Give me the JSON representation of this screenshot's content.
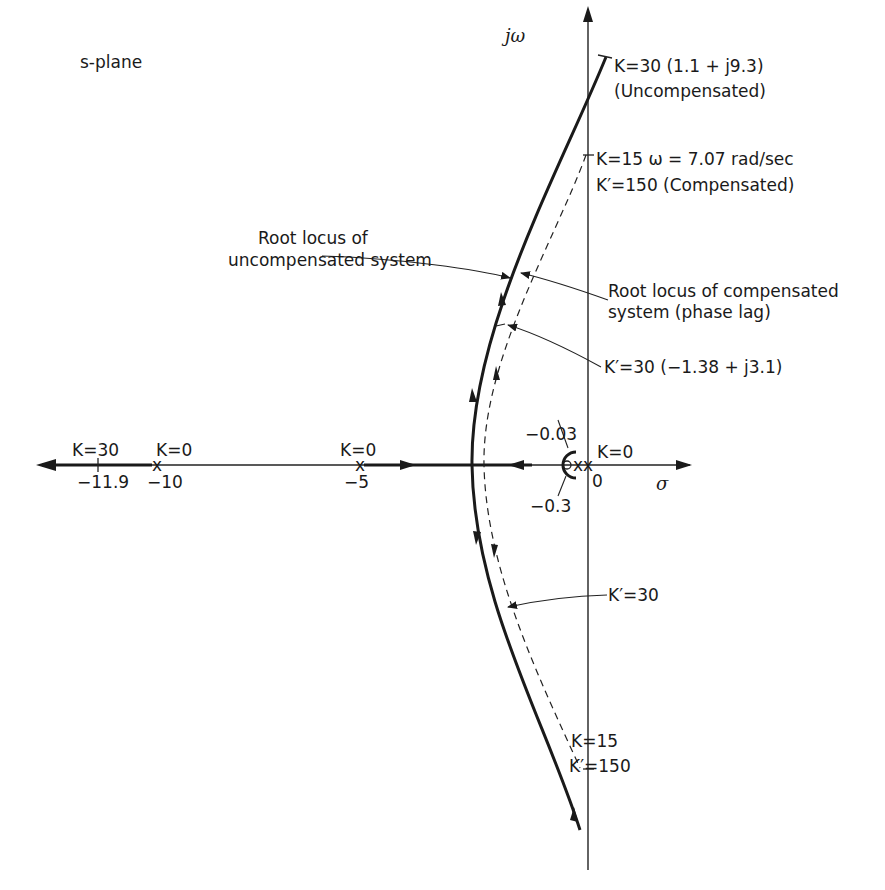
{
  "diagram": {
    "title": "s-plane",
    "axes": {
      "vertical": "jω",
      "horizontal": "σ"
    },
    "colors": {
      "ink": "#1a1a1a",
      "background": "#ffffff"
    },
    "labels": {
      "uncomp_top": "K=30  (1.1 + j9.3)",
      "uncomp_top_note": "(Uncompensated)",
      "crossing_top_1": "K=15  ω = 7.07 rad/sec",
      "crossing_top_2": "K′=150  (Compensated)",
      "root_locus_uncomp_1": "Root locus of",
      "root_locus_uncomp_2": "uncompensated system",
      "root_locus_comp_1": "Root locus of compensated",
      "root_locus_comp_2": "system (phase lag)",
      "kprime30_top": "K′=30  (−1.38 + j3.1)",
      "zero_label": "−0.03",
      "pole_origin_k": "K=0",
      "origin": "0",
      "pole_label": "−0.3",
      "k30_axis": "K=30",
      "k30_value": "−11.9",
      "k0_minus10": "K=0",
      "minus10": "−10",
      "k0_minus5": "K=0",
      "minus5": "−5",
      "kprime30_bottom": "K′=30",
      "crossing_bottom_1": "K=15",
      "crossing_bottom_2": "K′=150"
    },
    "points": {
      "poles": [
        0,
        -5,
        -10
      ],
      "compensator_pole": -0.03,
      "compensator_zero": -0.3,
      "uncompensated_k30": {
        "re": 1.1,
        "im": 9.3
      },
      "compensated_k30": {
        "re": -1.38,
        "im": 3.1
      },
      "crossing": {
        "k": 15,
        "k_prime": 150,
        "omega": 7.07
      },
      "breakaway_k30_real": -11.9
    }
  }
}
